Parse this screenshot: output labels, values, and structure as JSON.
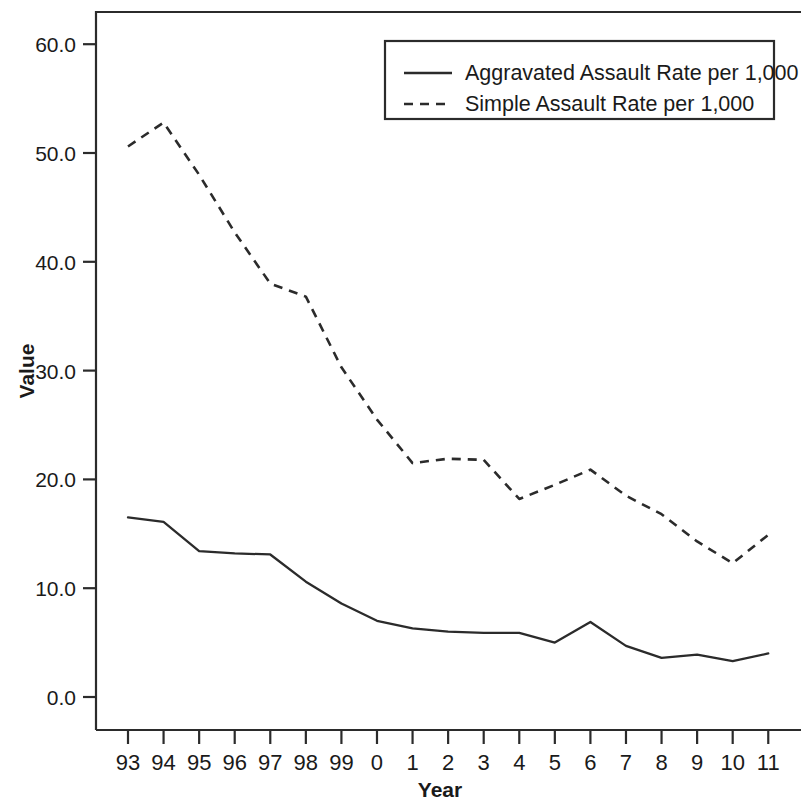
{
  "chart_data": {
    "type": "line",
    "title": "",
    "title_clipped_note": "",
    "xlabel": "Year",
    "ylabel": "Value",
    "categories": [
      "93",
      "94",
      "95",
      "96",
      "97",
      "98",
      "99",
      "0",
      "1",
      "2",
      "3",
      "4",
      "5",
      "6",
      "7",
      "8",
      "9",
      "10",
      "11"
    ],
    "x": [
      "93",
      "94",
      "95",
      "96",
      "97",
      "98",
      "99",
      "0",
      "1",
      "2",
      "3",
      "4",
      "5",
      "6",
      "7",
      "8",
      "9",
      "10",
      "11"
    ],
    "ylim": [
      0.0,
      65.0
    ],
    "yticks": [
      "0.0",
      "10.0",
      "20.0",
      "30.0",
      "40.0",
      "50.0",
      "60.0"
    ],
    "ytick_values": [
      0.0,
      10.0,
      20.0,
      30.0,
      40.0,
      50.0,
      60.0
    ],
    "grid": false,
    "legend_position": "top-right",
    "series": [
      {
        "name": "Aggravated Assault Rate per 1,000",
        "style": "solid",
        "values": [
          16.5,
          16.1,
          13.4,
          13.2,
          13.1,
          10.6,
          8.6,
          7.0,
          6.3,
          6.0,
          5.9,
          5.9,
          5.0,
          6.9,
          4.7,
          3.6,
          3.9,
          3.3,
          4.0
        ]
      },
      {
        "name": "Simple Assault Rate per 1,000",
        "style": "dashed",
        "values": [
          50.6,
          52.8,
          48.0,
          42.7,
          38.0,
          36.8,
          30.3,
          25.5,
          21.5,
          21.9,
          21.8,
          18.2,
          19.5,
          20.9,
          18.5,
          16.8,
          14.3,
          12.3,
          14.9
        ]
      }
    ],
    "legend": [
      {
        "label": "Aggravated Assault Rate per 1,000",
        "style": "solid"
      },
      {
        "label": "Simple Assault Rate per 1,000",
        "style": "dashed"
      }
    ]
  },
  "colors": {
    "ink": "#2b2b2b",
    "background": "#ffffff"
  }
}
